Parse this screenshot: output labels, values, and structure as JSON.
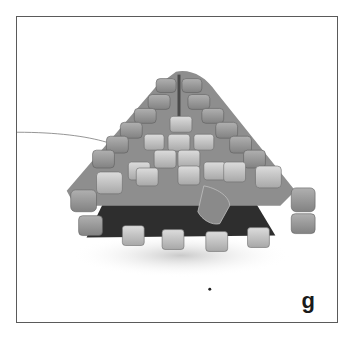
{
  "figure": {
    "label": "g",
    "colors": {
      "border": "#5a5a5a",
      "background": "#ffffff",
      "bead_light": "#c9c9c9",
      "bead_mid": "#9a9a9a",
      "bead_dark": "#6e6e6e",
      "interior": "#2a2a2a"
    }
  }
}
